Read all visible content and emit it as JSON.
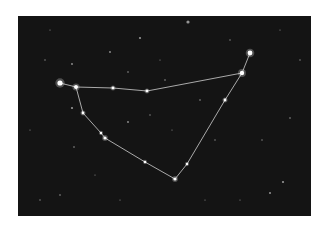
{
  "image": {
    "subject": "Capricornus constellation star chart",
    "background_color": "#141414",
    "border_color": "#ffffff",
    "line_color": "#d8d8d8",
    "star_color": "#ffffff"
  },
  "constellation": {
    "stars": [
      {
        "id": "s1",
        "x": 60,
        "y": 83,
        "r": 2.6
      },
      {
        "id": "s2",
        "x": 76,
        "y": 87,
        "r": 2.0
      },
      {
        "id": "s3",
        "x": 113,
        "y": 88,
        "r": 1.4
      },
      {
        "id": "s4",
        "x": 147,
        "y": 91,
        "r": 1.4
      },
      {
        "id": "s5",
        "x": 242,
        "y": 73,
        "r": 2.2
      },
      {
        "id": "s6",
        "x": 250,
        "y": 53,
        "r": 2.4
      },
      {
        "id": "s7",
        "x": 225,
        "y": 100,
        "r": 1.4
      },
      {
        "id": "s8",
        "x": 187,
        "y": 164,
        "r": 1.2
      },
      {
        "id": "s9",
        "x": 175,
        "y": 179,
        "r": 1.6
      },
      {
        "id": "s10",
        "x": 145,
        "y": 162,
        "r": 1.2
      },
      {
        "id": "s11",
        "x": 105,
        "y": 138,
        "r": 1.6
      },
      {
        "id": "s12",
        "x": 101,
        "y": 133,
        "r": 1.2
      },
      {
        "id": "s13",
        "x": 83,
        "y": 113,
        "r": 1.4
      }
    ],
    "lines": [
      [
        "s1",
        "s2"
      ],
      [
        "s2",
        "s3"
      ],
      [
        "s3",
        "s4"
      ],
      [
        "s4",
        "s5"
      ],
      [
        "s5",
        "s6"
      ],
      [
        "s5",
        "s7"
      ],
      [
        "s7",
        "s8"
      ],
      [
        "s8",
        "s9"
      ],
      [
        "s9",
        "s10"
      ],
      [
        "s10",
        "s11"
      ],
      [
        "s11",
        "s12"
      ],
      [
        "s12",
        "s13"
      ],
      [
        "s13",
        "s2"
      ]
    ]
  },
  "background_stars": [
    {
      "x": 188,
      "y": 22,
      "r": 1.6
    },
    {
      "x": 140,
      "y": 38,
      "r": 1.1
    },
    {
      "x": 110,
      "y": 52,
      "r": 0.9
    },
    {
      "x": 72,
      "y": 64,
      "r": 0.9
    },
    {
      "x": 128,
      "y": 72,
      "r": 0.8
    },
    {
      "x": 165,
      "y": 80,
      "r": 0.8
    },
    {
      "x": 72,
      "y": 108,
      "r": 1.1
    },
    {
      "x": 200,
      "y": 100,
      "r": 0.8
    },
    {
      "x": 128,
      "y": 122,
      "r": 0.9
    },
    {
      "x": 150,
      "y": 115,
      "r": 0.7
    },
    {
      "x": 74,
      "y": 147,
      "r": 0.8
    },
    {
      "x": 60,
      "y": 195,
      "r": 0.8
    },
    {
      "x": 40,
      "y": 200,
      "r": 0.7
    },
    {
      "x": 270,
      "y": 193,
      "r": 1.0
    },
    {
      "x": 283,
      "y": 182,
      "r": 1.1
    },
    {
      "x": 290,
      "y": 118,
      "r": 0.8
    },
    {
      "x": 45,
      "y": 60,
      "r": 0.7
    },
    {
      "x": 262,
      "y": 140,
      "r": 0.7
    },
    {
      "x": 230,
      "y": 40,
      "r": 0.7
    },
    {
      "x": 300,
      "y": 60,
      "r": 0.7
    },
    {
      "x": 215,
      "y": 140,
      "r": 0.7
    },
    {
      "x": 30,
      "y": 130,
      "r": 0.6
    },
    {
      "x": 95,
      "y": 175,
      "r": 0.6
    },
    {
      "x": 240,
      "y": 200,
      "r": 0.6
    },
    {
      "x": 172,
      "y": 130,
      "r": 0.6
    },
    {
      "x": 50,
      "y": 30,
      "r": 0.6
    },
    {
      "x": 280,
      "y": 30,
      "r": 0.6
    },
    {
      "x": 120,
      "y": 200,
      "r": 0.6
    },
    {
      "x": 205,
      "y": 200,
      "r": 0.6
    },
    {
      "x": 160,
      "y": 60,
      "r": 0.6
    }
  ]
}
